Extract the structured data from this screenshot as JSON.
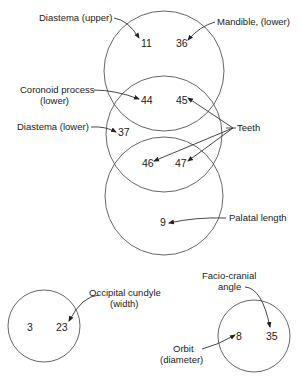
{
  "diagram": {
    "type": "venn-clusters",
    "groups": [
      {
        "id": "cluster-main",
        "circles": 3,
        "numbers": [
          "11",
          "36",
          "44",
          "45",
          "37",
          "46",
          "47",
          "9"
        ]
      },
      {
        "id": "cluster-left",
        "circles": 1,
        "numbers": [
          "3",
          "23"
        ]
      },
      {
        "id": "cluster-right",
        "circles": 1,
        "numbers": [
          "8",
          "35"
        ]
      }
    ],
    "labels": {
      "diastema_upper": "Diastema (upper)",
      "mandible_lower": "Mandible, (lower)",
      "coronoid_line1": "Coronoid process",
      "coronoid_line2": "(lower)",
      "diastema_lower": "Diastema (lower)",
      "teeth": "Teeth",
      "palatal_length": "Palatal length",
      "occipital_line1": "Occipital cundyle",
      "occipital_line2": "(width)",
      "facio_line1": "Facio-cranial",
      "facio_line2": "angle",
      "orbit_line1": "Orbit",
      "orbit_line2": "(diameter)"
    },
    "numbers": {
      "n11": "11",
      "n36": "36",
      "n44": "44",
      "n45": "45",
      "n37": "37",
      "n46": "46",
      "n47": "47",
      "n9": "9",
      "n3": "3",
      "n23": "23",
      "n8": "8",
      "n35": "35"
    }
  }
}
